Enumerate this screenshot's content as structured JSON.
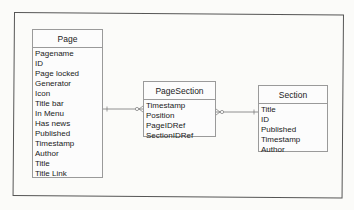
{
  "diagram": {
    "type": "entity-relationship",
    "entities": [
      {
        "name": "Page",
        "attributes": [
          "Pagename",
          "ID",
          "Page locked",
          "Generator",
          "Icon",
          "Title bar",
          "In Menu",
          "Has news",
          "Published",
          "Timestamp",
          "Author",
          "Title",
          "Title Link"
        ]
      },
      {
        "name": "PageSection",
        "attributes": [
          "Timestamp",
          "Position",
          "PageIDRef",
          "SectionIDRef"
        ]
      },
      {
        "name": "Section",
        "attributes": [
          "Title",
          "ID",
          "Published",
          "Timestamp",
          "Author"
        ]
      }
    ],
    "relationships": [
      {
        "from": "Page",
        "to": "PageSection",
        "from_end": "one",
        "to_end": "zero-or-many"
      },
      {
        "from": "PageSection",
        "to": "Section",
        "from_end": "zero-or-many",
        "to_end": "one"
      }
    ]
  },
  "colors": {
    "frame": "#555555",
    "entity_border": "#9a9a9a",
    "text": "#1a1a1a",
    "background": "#fbfbf9"
  }
}
